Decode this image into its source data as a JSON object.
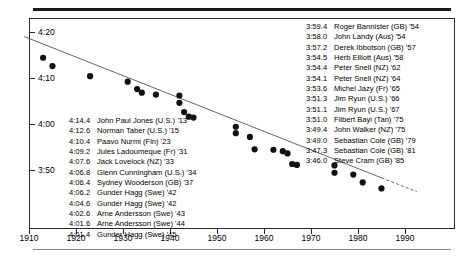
{
  "chart_data": {
    "type": "scatter",
    "title": "",
    "subtitle": "",
    "xlabel": "",
    "ylabel": "",
    "xlim": [
      1908,
      1994
    ],
    "ylim": [
      228,
      262
    ],
    "grid": false,
    "legend": null,
    "y_tick_labels": [
      "4:20",
      "4:10",
      "4:00",
      "3:50"
    ],
    "y_tick_values": [
      260,
      250,
      240,
      230
    ],
    "x_tick_labels": [
      "1910",
      "1920",
      "1930",
      "1940",
      "1950",
      "1960",
      "1970",
      "1980",
      "1990"
    ],
    "x_tick_values": [
      1910,
      1920,
      1930,
      1940,
      1950,
      1960,
      1970,
      1980,
      1990
    ],
    "series": [
      {
        "name": "Mile world records",
        "points": [
          {
            "x": 1913,
            "y": 254.4,
            "label": "4:14.4",
            "athlete": "John Paul Jones",
            "nation": "U.S.",
            "year": "'13"
          },
          {
            "x": 1915,
            "y": 252.6,
            "label": "4:12.6",
            "athlete": "Norman Taber",
            "nation": "U.S.",
            "year": "'15"
          },
          {
            "x": 1923,
            "y": 250.4,
            "label": "4:10.4",
            "athlete": "Paavo Nurmi",
            "nation": "Fin",
            "year": "'23"
          },
          {
            "x": 1931,
            "y": 249.2,
            "label": "4:09.2",
            "athlete": "Jules Ladoumeque",
            "nation": "Fr",
            "year": "'31"
          },
          {
            "x": 1933,
            "y": 247.6,
            "label": "4:07.6",
            "athlete": "Jack Lovelock",
            "nation": "NZ",
            "year": "'33"
          },
          {
            "x": 1934,
            "y": 246.8,
            "label": "4:06.8",
            "athlete": "Glenn Cunningham",
            "nation": "U.S.",
            "year": "'34"
          },
          {
            "x": 1937,
            "y": 246.4,
            "label": "4:06.4",
            "athlete": "Sydney Wooderson",
            "nation": "GB",
            "year": "'37"
          },
          {
            "x": 1942,
            "y": 246.2,
            "label": "4:06.2",
            "athlete": "Gunder Hagg",
            "nation": "Swe",
            "year": "'42"
          },
          {
            "x": 1942,
            "y": 244.6,
            "label": "4:04.6",
            "athlete": "Gunder Hagg",
            "nation": "Swe",
            "year": "'42"
          },
          {
            "x": 1943,
            "y": 242.6,
            "label": "4:02.6",
            "athlete": "Arne Andersson",
            "nation": "Swe",
            "year": "'43"
          },
          {
            "x": 1944,
            "y": 241.6,
            "label": "4:01.6",
            "athlete": "Arne Andersson",
            "nation": "Swe",
            "year": "'44"
          },
          {
            "x": 1945,
            "y": 241.4,
            "label": "4:01.4",
            "athlete": "Gunder Hagg",
            "nation": "Swe",
            "year": "'45"
          },
          {
            "x": 1954,
            "y": 239.4,
            "label": "3:59.4",
            "athlete": "Roger Bannister",
            "nation": "GB",
            "year": "'54"
          },
          {
            "x": 1954,
            "y": 238.0,
            "label": "3:58.0",
            "athlete": "John Landy",
            "nation": "Aus",
            "year": "'54"
          },
          {
            "x": 1957,
            "y": 237.2,
            "label": "3:57.2",
            "athlete": "Derek Ibbotson",
            "nation": "GB",
            "year": "'57"
          },
          {
            "x": 1958,
            "y": 234.5,
            "label": "3:54.5",
            "athlete": "Herb Elliott",
            "nation": "Aus",
            "year": "'58"
          },
          {
            "x": 1962,
            "y": 234.4,
            "label": "3:54.4",
            "athlete": "Peter Snell",
            "nation": "NZ",
            "year": "'62"
          },
          {
            "x": 1964,
            "y": 234.1,
            "label": "3:54.1",
            "athlete": "Peter Snell",
            "nation": "NZ",
            "year": "'64"
          },
          {
            "x": 1965,
            "y": 233.6,
            "label": "3:53.6",
            "athlete": "Michel Jazy",
            "nation": "Fr",
            "year": "'65"
          },
          {
            "x": 1966,
            "y": 231.3,
            "label": "3:51.3",
            "athlete": "Jim Ryun",
            "nation": "U.S.",
            "year": "'66"
          },
          {
            "x": 1967,
            "y": 231.1,
            "label": "3:51.1",
            "athlete": "Jim Ryun",
            "nation": "U.S.",
            "year": "'67"
          },
          {
            "x": 1975,
            "y": 231.0,
            "label": "3:51.0",
            "athlete": "Filbert Bayi",
            "nation": "Tan",
            "year": "'75"
          },
          {
            "x": 1975,
            "y": 229.4,
            "label": "3:49.4",
            "athlete": "John Walker",
            "nation": "NZ",
            "year": "'75"
          },
          {
            "x": 1979,
            "y": 229.0,
            "label": "3:49.0",
            "athlete": "Sebastian Cole",
            "nation": "GB",
            "year": "'79"
          },
          {
            "x": 1981,
            "y": 227.3,
            "label": "3:47.3",
            "athlete": "Sebastian Cole",
            "nation": "GB",
            "year": "'81"
          },
          {
            "x": 1985,
            "y": 226.0,
            "label": "3:46.0",
            "athlete": "Steve Cram",
            "nation": "GB",
            "year": "'85"
          }
        ]
      }
    ],
    "trend_line": {
      "style": "solid-then-dashed",
      "solid_from": {
        "x": 1909,
        "y": 259.0
      },
      "solid_to": {
        "x": 1985,
        "y": 228.3
      },
      "dashed_to": {
        "x": 1992.5,
        "y": 225.3
      }
    }
  },
  "left_list": [
    {
      "time": "4:14.4",
      "name": "John Paul Jones (U.S.) '13"
    },
    {
      "time": "4:12.6",
      "name": "Norman Taber (U.S.) '15"
    },
    {
      "time": "4:10.4",
      "name": "Paavo Nurmi (Fin) '23"
    },
    {
      "time": "4:09.2",
      "name": "Jules Ladoumeque (Fr) '31"
    },
    {
      "time": "4:07.6",
      "name": "Jack Lovelock (NZ) '33"
    },
    {
      "time": "4:06.8",
      "name": "Glenn Cunningham (U.S.) '34"
    },
    {
      "time": "4:06.4",
      "name": "Sydney Wooderson (GB) '37"
    },
    {
      "time": "4:06.2",
      "name": "Gunder Hagg (Swe) '42"
    },
    {
      "time": "4:04.6",
      "name": "Gunder Hagg (Swe) '42"
    },
    {
      "time": "4:02.6",
      "name": "Arne Andersson (Swe) '43"
    },
    {
      "time": "4:01.6",
      "name": "Arne Andersson (Swe) '44"
    },
    {
      "time": "4:01.4",
      "name": "Gunder Hagg (Swe) '45"
    }
  ],
  "right_list": [
    {
      "time": "3:59.4",
      "name": "Roger Bannister (GB) '54"
    },
    {
      "time": "3:58.0",
      "name": "John Landy (Aus) '54"
    },
    {
      "time": "3:57.2",
      "name": "Derek Ibbotson (GB) '57"
    },
    {
      "time": "3:54.5",
      "name": "Herb Elliott (Aus) '58"
    },
    {
      "time": "3:54.4",
      "name": "Peter Snell (NZ) '62"
    },
    {
      "time": "3:54.1",
      "name": "Peter Snell (NZ) '64"
    },
    {
      "time": "3:53.6",
      "name": "Michel Jazy (Fr) '65"
    },
    {
      "time": "3:51.3",
      "name": "Jim Ryun (U.S.) '66"
    },
    {
      "time": "3:51.1",
      "name": "Jim Ryun (U.S.) '67"
    },
    {
      "time": "3:51.0",
      "name": "Filbert Bayi (Tan) '75"
    },
    {
      "time": "3:49.4",
      "name": "John Walker (NZ) '75"
    },
    {
      "time": "3:49.0",
      "name": "Sebastian Cole (GB) '79"
    },
    {
      "time": "3:47.3",
      "name": "Sebastian Cole (GB) '81"
    },
    {
      "time": "3:46.0",
      "name": "Steve Cram (GB) '85"
    }
  ],
  "colors": {
    "ink": "#000000",
    "frame": "#2b2b2b",
    "rule_top": "#1a1a1a",
    "rule_bottom": "#8a8a8a",
    "point": "#111111",
    "trend": "#666666"
  }
}
